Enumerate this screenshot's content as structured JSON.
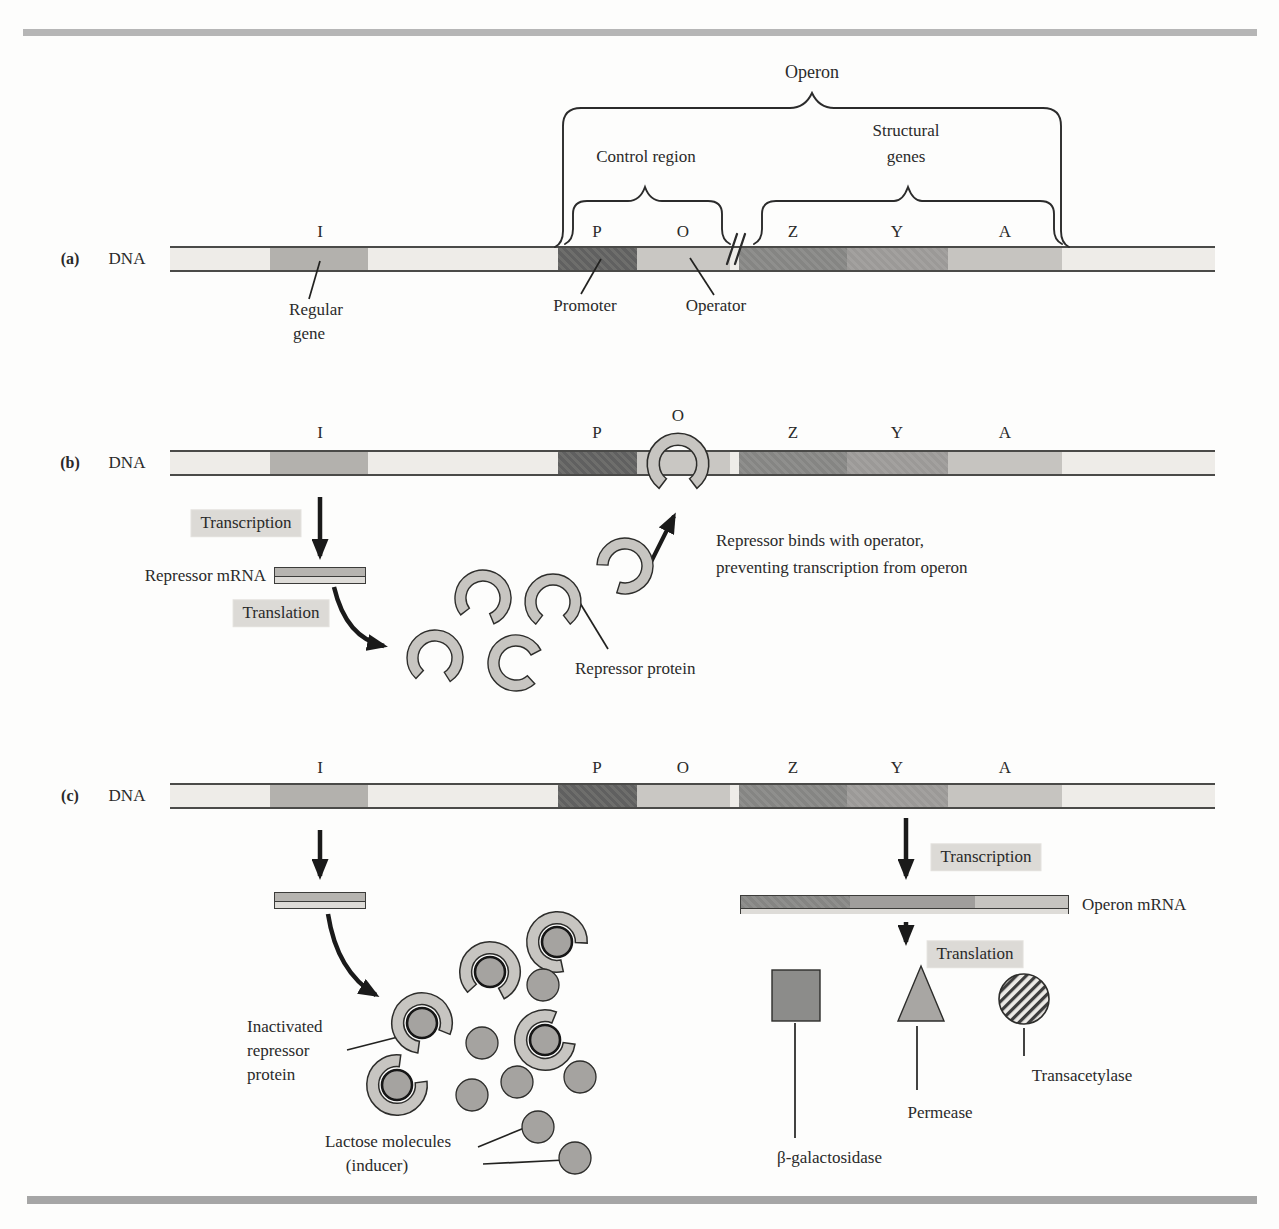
{
  "figure": {
    "gene_letters": [
      "I",
      "P",
      "O",
      "Z",
      "Y",
      "A"
    ],
    "colors": {
      "band_background": "#eeece8",
      "region_i": "#b3b1ad",
      "region_p": "#686866",
      "region_o": "#c9c7c3",
      "region_z": "#8b8b89",
      "region_y": "#a09e9c",
      "region_a": "#c6c4c0",
      "highlight_label_bg": "#dcdad6",
      "molecule_gray": "#a5a3a0",
      "repressor_gray": "#c7c5c1",
      "frame_top_bar": "#b6b6b6",
      "frame_bottom_bar": "#a6a6a6"
    },
    "panel_a": {
      "tag": "(a)",
      "dna": "DNA",
      "operon": "Operon",
      "control_region": "Control region",
      "structural_1": "Structural",
      "structural_2": "genes",
      "regular_1": "Regular",
      "regular_2": "gene",
      "promoter": "Promoter",
      "operator": "Operator"
    },
    "panel_b": {
      "tag": "(b)",
      "dna": "DNA",
      "transcription": "Transcription",
      "translation": "Translation",
      "repressor_mrna": "Repressor mRNA",
      "repressor_protein": "Repressor protein",
      "binds_1": "Repressor binds with operator,",
      "binds_2": "preventing transcription from operon"
    },
    "panel_c": {
      "tag": "(c)",
      "dna": "DNA",
      "transcription": "Transcription",
      "translation": "Translation",
      "operon_mrna": "Operon mRNA",
      "inactivated_1": "Inactivated",
      "inactivated_2": "repressor",
      "inactivated_3": "protein",
      "lactose_1": "Lactose molecules",
      "lactose_2": "(inducer)",
      "beta_galactosidase": "β-galactosidase",
      "permease": "Permease",
      "transacetylase": "Transacetylase"
    }
  }
}
